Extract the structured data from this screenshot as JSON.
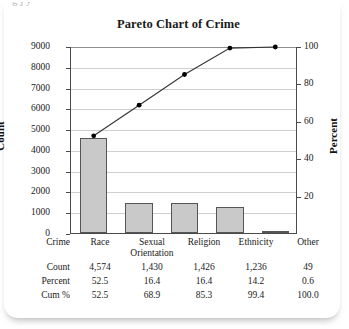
{
  "top_clip_text": "g        j      y",
  "chart_data": {
    "type": "bar",
    "title": "Pareto Chart of Crime",
    "categories": [
      "Race",
      "Sexual Orientation",
      "Religion",
      "Ethnicity",
      "Other"
    ],
    "values": [
      4574,
      1430,
      1426,
      1236,
      49
    ],
    "cumulative_percent": [
      52.5,
      68.9,
      85.3,
      99.4,
      100.0
    ],
    "percent": [
      52.5,
      16.4,
      16.4,
      14.2,
      0.6
    ],
    "xlabel": "Crime",
    "ylabel": "Count",
    "y2label": "Percent",
    "ylim": [
      0,
      9000
    ],
    "y2lim": [
      0,
      100
    ],
    "yticks": [
      0,
      1000,
      2000,
      3000,
      4000,
      5000,
      6000,
      7000,
      8000,
      9000
    ],
    "yticklabels": [
      "0",
      "1000",
      "2000",
      "3000",
      "4000",
      "5000",
      "6000",
      "7000",
      "8000",
      "9000"
    ],
    "y2ticks": [
      20,
      40,
      60,
      80,
      100
    ],
    "y2ticklabels": [
      "20",
      "40",
      "60",
      "80",
      "100"
    ],
    "grid": true,
    "legend": "none",
    "bar_color": "#c9c9c9",
    "bar_edge_color": "#555555",
    "line_color": "#333333",
    "marker_color": "#000000"
  },
  "table": {
    "rows": [
      {
        "label": "Crime",
        "cells": [
          "Race",
          "Sexual Orientation",
          "Religion",
          "Ethnicity",
          "Other"
        ]
      },
      {
        "label": "Count",
        "cells": [
          "4,574",
          "1,430",
          "1,426",
          "1,236",
          "49"
        ]
      },
      {
        "label": "Percent",
        "cells": [
          "52.5",
          "16.4",
          "16.4",
          "14.2",
          "0.6"
        ]
      },
      {
        "label": "Cum %",
        "cells": [
          "52.5",
          "68.9",
          "85.3",
          "99.4",
          "100.0"
        ]
      }
    ]
  }
}
